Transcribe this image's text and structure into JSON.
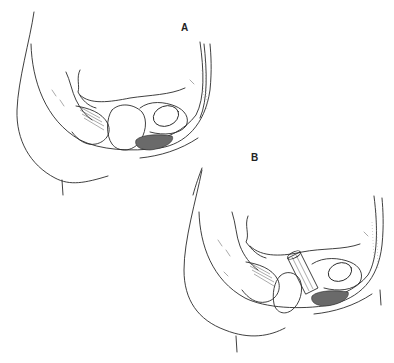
{
  "figure": {
    "type": "anatomical line drawing",
    "panels": [
      {
        "id": "A",
        "label": "A"
      },
      {
        "id": "B",
        "label": "B"
      }
    ]
  },
  "colors": {
    "background": "#ffffff",
    "line": "#2a2a2a"
  }
}
